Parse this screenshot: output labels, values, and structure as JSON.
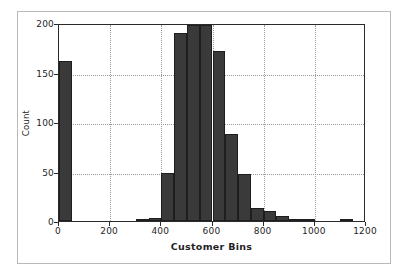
{
  "chart_data": {
    "type": "bar",
    "title": "",
    "subtitle": "",
    "xlabel": "Customer Bins",
    "ylabel": "Count",
    "xlim": [
      0,
      1200
    ],
    "ylim": [
      0,
      200
    ],
    "xticks": [
      0,
      200,
      400,
      600,
      800,
      1000,
      1200
    ],
    "xticklabels": [
      "0",
      "200",
      "400",
      "600",
      "800",
      "1000",
      "1200"
    ],
    "yticks": [
      0,
      50,
      100,
      150,
      200
    ],
    "yticklabels": [
      "0",
      "50",
      "100",
      "150",
      "200"
    ],
    "grid": true,
    "grid_style": "dotted",
    "legend": null,
    "bar_color": "#3a3a3a",
    "bar_edge_color": "#1e1e1e",
    "bin_width": 50,
    "bin_edges": [
      0,
      50,
      100,
      150,
      200,
      250,
      300,
      350,
      400,
      450,
      500,
      550,
      600,
      650,
      700,
      750,
      800,
      850,
      900,
      950,
      1000,
      1050,
      1100,
      1150,
      1200
    ],
    "bin_starts": [
      0,
      50,
      100,
      150,
      200,
      250,
      300,
      350,
      400,
      450,
      500,
      550,
      600,
      650,
      700,
      750,
      800,
      850,
      900,
      950,
      1000,
      1050,
      1100,
      1150
    ],
    "categories": [
      "0-50",
      "50-100",
      "100-150",
      "150-200",
      "200-250",
      "250-300",
      "300-350",
      "350-400",
      "400-450",
      "450-500",
      "500-550",
      "550-600",
      "600-650",
      "650-700",
      "700-750",
      "750-800",
      "800-850",
      "850-900",
      "900-950",
      "950-1000",
      "1000-1050",
      "1050-1100",
      "1100-1150",
      "1150-1200"
    ],
    "values": [
      162,
      0,
      0,
      0,
      0,
      0,
      2,
      3,
      48,
      190,
      198,
      198,
      172,
      88,
      47,
      13,
      10,
      5,
      1,
      1,
      0,
      0,
      2,
      0
    ]
  },
  "axis": {
    "xlabel": "Customer Bins",
    "ylabel": "Count"
  }
}
